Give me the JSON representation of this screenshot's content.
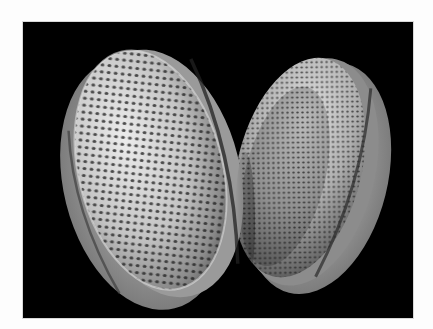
{
  "image": {
    "subject": "two reticulate pollen grains (scanning electron micrograph)",
    "background_color": "#000000",
    "page_color": "#fdfdfd",
    "grain_tone_light": "#e6e6e6",
    "grain_tone_mid": "#a8a8a8",
    "grain_tone_dark": "#3a3a3a",
    "grains": [
      {
        "name": "left-grain",
        "position": "left-foreground"
      },
      {
        "name": "right-grain",
        "position": "right-background"
      }
    ]
  }
}
